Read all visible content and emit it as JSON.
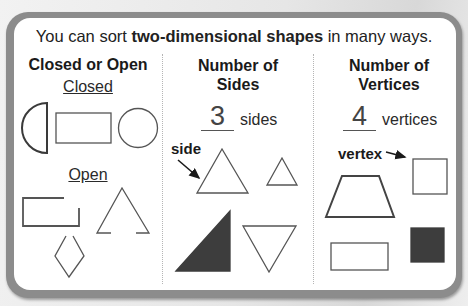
{
  "intro": {
    "prefix": "You can sort ",
    "bold": "two-dimensional shapes",
    "suffix": " in many ways."
  },
  "columns": [
    {
      "title_line1": "Closed or Open",
      "groups": [
        {
          "label": "Closed",
          "shapes": [
            "half-circle",
            "rectangle",
            "circle"
          ]
        },
        {
          "label": "Open",
          "shapes": [
            "open-rectangle",
            "open-triangle",
            "open-rhombus"
          ]
        }
      ]
    },
    {
      "title_line1": "Number of",
      "title_line2": "Sides",
      "answer": "3",
      "unit": "sides",
      "callout": "side",
      "shapes": [
        "triangle",
        "small-triangle",
        "filled-right-triangle",
        "inverted-triangle"
      ]
    },
    {
      "title_line1": "Number of",
      "title_line2": "Vertices",
      "answer": "4",
      "unit": "vertices",
      "callout": "vertex",
      "shapes": [
        "square",
        "trapezoid",
        "rectangle",
        "filled-square"
      ]
    }
  ],
  "colors": {
    "frame": "#8c8c8c",
    "panel": "#ffffff",
    "stroke": "#555555",
    "fill_dark": "#3d3d3d"
  }
}
